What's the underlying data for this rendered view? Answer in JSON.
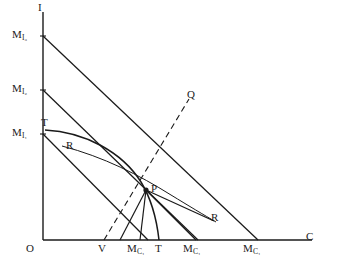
{
  "figure": {
    "type": "economics-transformation-diagram",
    "background_color": "#ffffff",
    "line_color": "#1a1a1a",
    "axes": {
      "y_axis_label": "I",
      "x_axis_label": "C",
      "origin_label": "O"
    },
    "y_intercepts": [
      {
        "id": "mi3",
        "main": "M",
        "sub": "I₃",
        "value_px": 36
      },
      {
        "id": "mi2",
        "main": "M",
        "sub": "I₂",
        "value_px": 90
      },
      {
        "id": "mi1",
        "main": "M",
        "sub": "I₁",
        "value_px": 134
      }
    ],
    "x_intercepts": [
      {
        "id": "mc1",
        "main": "M",
        "sub": "C₁",
        "value_px": 148
      },
      {
        "id": "mc2",
        "main": "M",
        "sub": "C₁",
        "value_px": 198
      },
      {
        "id": "mc3",
        "main": "M",
        "sub": "C₁",
        "value_px": 258
      }
    ],
    "point_labels": [
      {
        "id": "T-top",
        "text": "T",
        "role": "transformation-curve-upper-end"
      },
      {
        "id": "T-bottom",
        "text": "T",
        "role": "transformation-curve-lower-end"
      },
      {
        "id": "R-upper",
        "text": "R",
        "role": "indifference-curve-upper"
      },
      {
        "id": "R-lower",
        "text": "R",
        "role": "indifference-curve-lower"
      },
      {
        "id": "P",
        "text": "P",
        "role": "equilibrium-point"
      },
      {
        "id": "Q",
        "text": "Q",
        "role": "expansion-path-end"
      },
      {
        "id": "V",
        "text": "V",
        "role": "expansion-path-x-intercept"
      }
    ],
    "curves": [
      {
        "name": "budget-line-3",
        "style": "solid",
        "from": "M I3",
        "to": "M C1 (outer)"
      },
      {
        "name": "budget-line-2",
        "style": "solid",
        "from": "M I2",
        "to": "M C1 (middle)"
      },
      {
        "name": "budget-line-1",
        "style": "solid",
        "from": "M I1",
        "to": "M C1 (inner)"
      },
      {
        "name": "transformation-curve-TT",
        "style": "solid-concave",
        "from": "T",
        "to": "T"
      },
      {
        "name": "indifference-curve-RR",
        "style": "solid-convex",
        "from": "R",
        "to": "R"
      },
      {
        "name": "expansion-path-VQ",
        "style": "dashed",
        "from": "V",
        "to": "Q"
      }
    ]
  }
}
